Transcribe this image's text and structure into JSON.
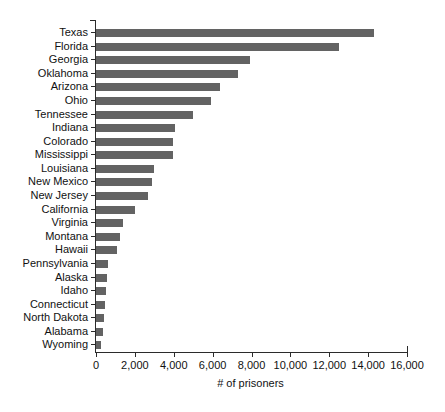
{
  "chart_data": {
    "type": "bar",
    "orientation": "horizontal",
    "title": "",
    "xlabel": "# of prisoners",
    "ylabel": "",
    "xlim": [
      0,
      16000
    ],
    "ylim": null,
    "grid": false,
    "legend": null,
    "bar_color": "#636363",
    "axis_color": "#2b2b2b",
    "xticks": [
      0,
      2000,
      4000,
      6000,
      8000,
      10000,
      12000,
      14000,
      16000
    ],
    "xtick_labels": [
      "0",
      "2,000",
      "4,000",
      "6,000",
      "8,000",
      "10,000",
      "12,000",
      "14,000",
      "16,000"
    ],
    "categories": [
      "Texas",
      "Florida",
      "Georgia",
      "Oklahoma",
      "Arizona",
      "Ohio",
      "Tennessee",
      "Indiana",
      "Colorado",
      "Mississippi",
      "Louisiana",
      "New Mexico",
      "New Jersey",
      "California",
      "Virginia",
      "Montana",
      "Hawaii",
      "Pennsylvania",
      "Alaska",
      "Idaho",
      "Connecticut",
      "North Dakota",
      "Alabama",
      "Wyoming"
    ],
    "values": [
      14300,
      12500,
      7900,
      7300,
      6400,
      5900,
      5000,
      4050,
      3950,
      3950,
      3000,
      2900,
      2700,
      2000,
      1400,
      1250,
      1100,
      600,
      560,
      540,
      480,
      400,
      360,
      250
    ]
  }
}
